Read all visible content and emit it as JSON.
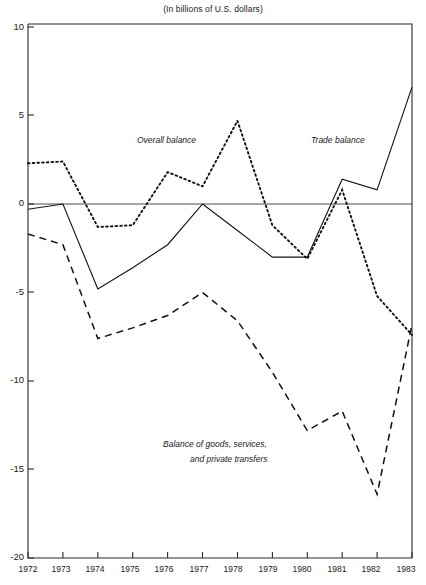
{
  "chart_data": {
    "type": "line",
    "title": "(In billions of U.S. dollars)",
    "xlabel": "",
    "ylabel": "",
    "x": [
      1972,
      1973,
      1974,
      1975,
      1976,
      1977,
      1978,
      1979,
      1980,
      1981,
      1982,
      1983
    ],
    "categories": [
      "1972",
      "1973",
      "1974",
      "1975",
      "1976",
      "1977",
      "1978",
      "1979",
      "1980",
      "1981",
      "1982",
      "1983"
    ],
    "xlim": [
      1972,
      1983
    ],
    "ylim": [
      -20,
      10
    ],
    "yticks": [
      10,
      5,
      0,
      -5,
      -10,
      -15,
      -20
    ],
    "ytick_labels": [
      "10",
      "5",
      "0",
      "-5",
      "-10",
      "-15",
      "-20"
    ],
    "grid": false,
    "legend_position": "inline-annotations",
    "zero_line": true,
    "series": [
      {
        "name": "Overall balance",
        "style": "dotted",
        "color": "#111111",
        "values": [
          2.3,
          2.4,
          -1.3,
          -1.2,
          1.8,
          1.0,
          4.7,
          -1.2,
          -3.1,
          0.8,
          -5.2,
          -7.4
        ]
      },
      {
        "name": "Trade balance",
        "style": "solid",
        "color": "#111111",
        "values": [
          -0.3,
          0.0,
          -4.8,
          -3.6,
          -2.3,
          0.0,
          -1.5,
          -3.0,
          -3.0,
          1.4,
          0.8,
          6.6
        ]
      },
      {
        "name": "Balance of goods, services, and private transfers",
        "style": "dashed",
        "color": "#111111",
        "values": [
          -1.7,
          -2.3,
          -7.6,
          -7.0,
          -6.3,
          -5.0,
          -6.6,
          -9.5,
          -12.8,
          -11.7,
          -16.4,
          -6.8
        ]
      }
    ],
    "annotations": [
      {
        "text": "Overall balance",
        "series": "Overall balance"
      },
      {
        "text": "Trade balance",
        "series": "Trade balance"
      },
      {
        "text": "Balance of goods, services,",
        "series": "Balance of goods, services, and private transfers"
      },
      {
        "text": "and private transfers",
        "series": "Balance of goods, services, and private transfers"
      }
    ]
  }
}
